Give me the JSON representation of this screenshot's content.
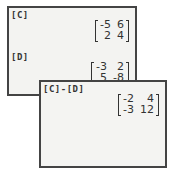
{
  "back_screen": {
    "matrices": [
      {
        "label": "[C]",
        "rows": [
          [
            "-5",
            "6"
          ],
          [
            "2",
            "4"
          ]
        ]
      },
      {
        "label": "[D]",
        "rows": [
          [
            "-3",
            "2"
          ],
          [
            "5",
            "-8"
          ]
        ]
      }
    ]
  },
  "front_screen": {
    "expression": "[C]-[D]",
    "result": {
      "rows": [
        [
          "-2",
          "4"
        ],
        [
          "-3",
          "12"
        ]
      ]
    }
  }
}
